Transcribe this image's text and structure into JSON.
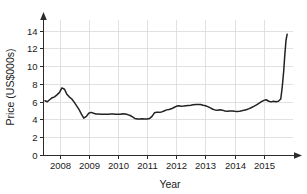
{
  "chart_data": {
    "type": "line",
    "title": "",
    "subtitle": "",
    "xlabel": "Year",
    "ylabel": "Price (US$000s)",
    "xlim": [
      2007.45,
      2016.0
    ],
    "ylim": [
      0,
      15.2
    ],
    "grid": true,
    "legend": null,
    "x_ticks": [
      2008,
      2009,
      2010,
      2011,
      2012,
      2013,
      2014,
      2015
    ],
    "x_tick_labels": [
      "2008",
      "2009",
      "2010",
      "2011",
      "2012",
      "2013",
      "2014",
      "2015"
    ],
    "y_ticks": [
      0,
      2,
      4,
      6,
      8,
      10,
      12,
      14
    ],
    "y_tick_labels": [
      "0",
      "2",
      "4",
      "6",
      "8",
      "10",
      "12",
      "14"
    ],
    "series": [
      {
        "name": "Price",
        "color": "#222222",
        "x": [
          2007.5,
          2007.58,
          2007.67,
          2007.75,
          2007.83,
          2007.92,
          2008.0,
          2008.08,
          2008.17,
          2008.25,
          2008.33,
          2008.42,
          2008.5,
          2008.58,
          2008.67,
          2008.75,
          2008.83,
          2008.92,
          2009.0,
          2009.08,
          2009.17,
          2009.25,
          2009.33,
          2009.42,
          2009.5,
          2009.58,
          2009.67,
          2009.75,
          2009.83,
          2009.92,
          2010.0,
          2010.08,
          2010.17,
          2010.25,
          2010.33,
          2010.42,
          2010.5,
          2010.58,
          2010.67,
          2010.75,
          2010.83,
          2010.92,
          2011.0,
          2011.08,
          2011.17,
          2011.25,
          2011.33,
          2011.42,
          2011.5,
          2011.58,
          2011.67,
          2011.75,
          2011.83,
          2011.92,
          2012.0,
          2012.08,
          2012.17,
          2012.25,
          2012.33,
          2012.42,
          2012.5,
          2012.58,
          2012.67,
          2012.75,
          2012.83,
          2012.92,
          2013.0,
          2013.08,
          2013.17,
          2013.25,
          2013.33,
          2013.42,
          2013.5,
          2013.58,
          2013.67,
          2013.75,
          2013.83,
          2013.92,
          2014.0,
          2014.08,
          2014.17,
          2014.25,
          2014.33,
          2014.42,
          2014.5,
          2014.58,
          2014.67,
          2014.75,
          2014.83,
          2014.92,
          2015.0,
          2015.08,
          2015.17,
          2015.25,
          2015.33,
          2015.42,
          2015.5,
          2015.58,
          2015.63,
          2015.68,
          2015.72,
          2015.76,
          2015.8
        ],
        "y": [
          6.1,
          6.0,
          6.25,
          6.45,
          6.55,
          6.8,
          7.05,
          7.55,
          7.4,
          6.85,
          6.55,
          6.3,
          5.95,
          5.55,
          5.1,
          4.6,
          4.15,
          4.35,
          4.7,
          4.8,
          4.7,
          4.62,
          4.62,
          4.6,
          4.58,
          4.58,
          4.6,
          4.62,
          4.62,
          4.6,
          4.6,
          4.58,
          4.65,
          4.62,
          4.55,
          4.45,
          4.3,
          4.12,
          4.05,
          4.05,
          4.08,
          4.05,
          4.05,
          4.1,
          4.35,
          4.75,
          4.82,
          4.8,
          4.85,
          4.95,
          5.08,
          5.12,
          5.2,
          5.35,
          5.48,
          5.55,
          5.5,
          5.52,
          5.55,
          5.58,
          5.6,
          5.65,
          5.68,
          5.7,
          5.68,
          5.6,
          5.55,
          5.45,
          5.3,
          5.15,
          5.08,
          5.05,
          5.1,
          5.05,
          4.95,
          4.92,
          4.95,
          4.95,
          4.92,
          4.9,
          4.92,
          4.98,
          5.05,
          5.12,
          5.22,
          5.35,
          5.5,
          5.65,
          5.82,
          6.0,
          6.15,
          6.22,
          6.05,
          5.98,
          6.05,
          6.0,
          6.05,
          6.3,
          7.6,
          9.4,
          11.3,
          12.9,
          13.6
        ]
      }
    ],
    "annotations": []
  },
  "axis": {
    "y_title": "Price (US$000s)",
    "x_title": "Year"
  },
  "colors": {
    "line": "#222222",
    "grid": "#d9d9d9",
    "axis": "#2b2b2b",
    "background": "#ffffff"
  }
}
